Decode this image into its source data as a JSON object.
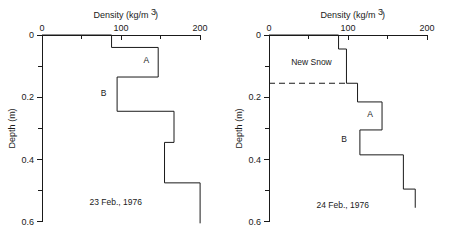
{
  "figure": {
    "title": "",
    "background_color": "#ffffff",
    "line_color": "#1a1a1a"
  },
  "axes": {
    "x_title": "Density (kg/m",
    "x_title_sup": "3",
    "x_title_close": ")",
    "x_title_full": "Density (kg/m3)",
    "y_title": "Depth (m)",
    "x_ticks": [
      {
        "value": 0,
        "label": "0"
      },
      {
        "value": 50,
        "label": ""
      },
      {
        "value": 100,
        "label": "100"
      },
      {
        "value": 150,
        "label": ""
      },
      {
        "value": 200,
        "label": "200"
      }
    ],
    "y_ticks": [
      {
        "value": 0.0,
        "label": "0"
      },
      {
        "value": 0.1,
        "label": ""
      },
      {
        "value": 0.2,
        "label": "0.2"
      },
      {
        "value": 0.3,
        "label": ""
      },
      {
        "value": 0.4,
        "label": "0.4"
      },
      {
        "value": 0.5,
        "label": ""
      },
      {
        "value": 0.6,
        "label": "0.6"
      }
    ],
    "xlim": [
      0,
      210
    ],
    "ylim": [
      0,
      0.62
    ],
    "x_axis_position": "top",
    "grid": false,
    "legend": "none"
  },
  "chart_data": [
    {
      "type": "line",
      "panel": "left",
      "title": "23 Feb., 1976",
      "xlabel": "Density (kg/m3)",
      "ylabel": "Depth (m)",
      "xlim": [
        0,
        210
      ],
      "ylim": [
        0,
        0.62
      ],
      "grid": false,
      "orientation": "step-profile-vertical",
      "description": "Snow density step profile, depth increasing downward",
      "layers": [
        {
          "depth_top": 0.0,
          "depth_bottom": 0.04,
          "density": 88
        },
        {
          "depth_top": 0.04,
          "depth_bottom": 0.135,
          "density": 147
        },
        {
          "depth_top": 0.135,
          "depth_bottom": 0.245,
          "density": 95
        },
        {
          "depth_top": 0.245,
          "depth_bottom": 0.345,
          "density": 167
        },
        {
          "depth_top": 0.345,
          "depth_bottom": 0.475,
          "density": 155
        },
        {
          "depth_top": 0.475,
          "depth_bottom": 0.605,
          "density": 200
        }
      ],
      "annotations": [
        {
          "text": "A",
          "density": 132,
          "depth": 0.09
        },
        {
          "text": "B",
          "density": 78,
          "depth": 0.195
        }
      ],
      "date_label": {
        "text": "23 Feb., 1976",
        "density": 60,
        "depth": 0.545
      }
    },
    {
      "type": "line",
      "panel": "right",
      "title": "24 Feb., 1976",
      "xlabel": "Density (kg/m3)",
      "ylabel": "Depth (m)",
      "xlim": [
        0,
        210
      ],
      "ylim": [
        0,
        0.62
      ],
      "grid": false,
      "orientation": "step-profile-vertical",
      "description": "Snow density step profile with new snow layer marked",
      "layers": [
        {
          "depth_top": 0.0,
          "depth_bottom": 0.045,
          "density": 88
        },
        {
          "depth_top": 0.045,
          "depth_bottom": 0.155,
          "density": 98
        },
        {
          "depth_top": 0.155,
          "depth_bottom": 0.215,
          "density": 112
        },
        {
          "depth_top": 0.215,
          "depth_bottom": 0.305,
          "density": 143
        },
        {
          "depth_top": 0.305,
          "depth_bottom": 0.385,
          "density": 115
        },
        {
          "depth_top": 0.385,
          "depth_bottom": 0.495,
          "density": 170
        },
        {
          "depth_top": 0.495,
          "depth_bottom": 0.555,
          "density": 185
        }
      ],
      "annotations": [
        {
          "text": "A",
          "density": 128,
          "depth": 0.262
        },
        {
          "text": "B",
          "density": 95,
          "depth": 0.345
        }
      ],
      "marker_lines": [
        {
          "text": "New Snow",
          "depth": 0.155,
          "x_start": 0,
          "x_end": 98,
          "style": "dashed",
          "label_density": 28,
          "label_depth": 0.095
        }
      ],
      "date_label": {
        "text": "24 Feb., 1976",
        "density": 60,
        "depth": 0.555
      }
    }
  ]
}
